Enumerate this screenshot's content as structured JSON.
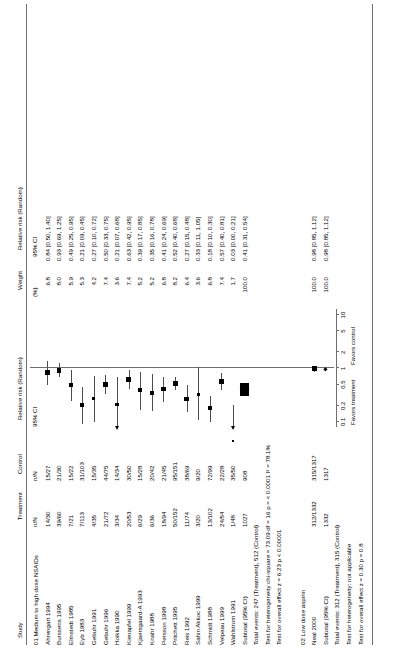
{
  "headers": {
    "study": "Study",
    "treatment_l1": "Treatment",
    "treatment_l2": "n/N",
    "control_l1": "Control",
    "control_l2": "n/N",
    "forest_l1": "Relative risk (Random)",
    "forest_l2": "95% CI",
    "weight_l1": "Weight",
    "weight_l2": "(%)",
    "rr_l1": "Relative risk (Random)",
    "rr_l2": "95% CI"
  },
  "axis": {
    "ticks": [
      "0.1",
      "0.2",
      "0.5",
      "1",
      "2",
      "5",
      "10"
    ],
    "tick_values": [
      0.1,
      0.2,
      0.5,
      1,
      2,
      5,
      10
    ],
    "favors_left": "Favors treatment",
    "favors_right": "Favors control",
    "xmin": 0.08,
    "xmax": 13
  },
  "groups": [
    {
      "label": "01 Medium to high dose NSAIDs",
      "studies": [
        {
          "name": "Ahrengart 1994",
          "treatment": "14/30",
          "control": "15/27",
          "weight": "6.8",
          "rr_text": "0.84 [0.50, 1.40]",
          "rr": 0.84,
          "lo": 0.5,
          "hi": 1.4
        },
        {
          "name": "Burssens 1995",
          "treatment": "39/60",
          "control": "21/30",
          "weight": "8.0",
          "rr_text": "0.93 [0.69, 1.25]",
          "rr": 0.93,
          "lo": 0.69,
          "hi": 1.25
        },
        {
          "name": "Elmstedt 1985",
          "treatment": "7/21",
          "control": "15/22",
          "weight": "5.9",
          "rr_text": "0.49 [0.25, 0.95]",
          "rr": 0.49,
          "lo": 0.25,
          "hi": 0.95
        },
        {
          "name": "Eyb 1983",
          "treatment": "7/113",
          "control": "31/103",
          "weight": "5.3",
          "rr_text": "0.21 [0.09, 0.45]",
          "rr": 0.21,
          "lo": 0.09,
          "hi": 0.45
        },
        {
          "name": "Gebuhr 1991",
          "treatment": "4/35",
          "control": "15/35",
          "weight": "4.2",
          "rr_text": "0.27 [0.10, 0.72]",
          "rr": 0.27,
          "lo": 0.1,
          "hi": 0.72
        },
        {
          "name": "Gebuhr 1996",
          "treatment": "21/72",
          "control": "44/75",
          "weight": "7.4",
          "rr_text": "0.50 [0.33, 0.75]",
          "rr": 0.5,
          "lo": 0.33,
          "hi": 0.75
        },
        {
          "name": "Hoikka 1990",
          "treatment": "3/34",
          "control": "14/34",
          "weight": "3.6",
          "rr_text": "0.21 [0.07, 0.68]",
          "rr": 0.21,
          "lo": 0.07,
          "hi": 0.68
        },
        {
          "name": "Kienapfel 1999",
          "treatment": "20/53",
          "control": "30/50",
          "weight": "7.4",
          "rr_text": "0.63 [0.42, 0.95]",
          "rr": 0.63,
          "lo": 0.42,
          "hi": 0.95
        },
        {
          "name": "Kjaersgaard-A 1993",
          "treatment": "6/29",
          "control": "15/28",
          "weight": "5.2",
          "rr_text": "0.39 [0.17, 0.85]",
          "rr": 0.39,
          "lo": 0.17,
          "hi": 0.85
        },
        {
          "name": "Knahr 1988",
          "treatment": "6/36",
          "control": "20/42",
          "weight": "5.2",
          "rr_text": "0.35 [0.16, 0.78]",
          "rr": 0.35,
          "lo": 0.16,
          "hi": 0.78
        },
        {
          "name": "Persson 1998",
          "treatment": "18/94",
          "control": "21/45",
          "weight": "6.8",
          "rr_text": "0.41 [0.24, 0.69]",
          "rr": 0.41,
          "lo": 0.24,
          "hi": 0.69
        },
        {
          "name": "Pritchett 1995",
          "treatment": "50/152",
          "control": "95/151",
          "weight": "8.2",
          "rr_text": "0.52 [0.40, 0.68]",
          "rr": 0.52,
          "lo": 0.4,
          "hi": 0.68
        },
        {
          "name": "Reis 1992",
          "treatment": "11/74",
          "control": "38/69",
          "weight": "6.4",
          "rr_text": "0.27 [0.15, 0.48]",
          "rr": 0.27,
          "lo": 0.15,
          "hi": 0.48
        },
        {
          "name": "Sahin Akkoc 1999",
          "treatment": "3/20",
          "control": "9/20",
          "weight": "3.6",
          "rr_text": "0.33 [0.11, 1.05]",
          "rr": 0.33,
          "lo": 0.11,
          "hi": 1.05
        },
        {
          "name": "Schmidt 1988",
          "treatment": "13/102",
          "control": "72/99",
          "weight": "6.8",
          "rr_text": "0.18 [0.10, 0.30]",
          "rr": 0.18,
          "lo": 0.1,
          "hi": 0.3
        },
        {
          "name": "Velpeau 1999",
          "treatment": "24/54",
          "control": "22/28",
          "weight": "7.4",
          "rr_text": "0.57 [0.40, 0.81]",
          "rr": 0.57,
          "lo": 0.4,
          "hi": 0.81
        },
        {
          "name": "Wahlstrom 1991",
          "treatment": "1/48",
          "control": "35/50",
          "weight": "1.7",
          "rr_text": "0.03 [0.00, 0.21]",
          "rr": 0.03,
          "lo": 0.004,
          "hi": 0.21
        }
      ],
      "subtotal": {
        "label": "Subtotal (95% CI)",
        "treatment": "1027",
        "control": "908",
        "weight": "100.0",
        "rr_text": "0.41 [0.31, 0.54]",
        "rr": 0.41,
        "lo": 0.31,
        "hi": 0.54
      },
      "stats": [
        "Total events: 247 (Treatment), 512 (Control)",
        "Test for heterogeneity chi-square = 73.09 df = 16 p = < 0.0001 I² = 78.1%",
        "Test for overall effect z = 6.23 p < 0.00001"
      ]
    },
    {
      "label": "02 Low dose aspirin",
      "studies": [
        {
          "name": "Neal 2000",
          "treatment": "312/1332",
          "control": "315/1317",
          "weight": "100.0",
          "rr_text": "0.98 [0.85, 1.12]",
          "rr": 0.98,
          "lo": 0.85,
          "hi": 1.12
        }
      ],
      "subtotal": {
        "label": "Subtotal (95% CI)",
        "treatment": "1332",
        "control": "1317",
        "weight": "100.0",
        "rr_text": "0.98 [0.85, 1.12]",
        "rr": 0.98,
        "lo": 0.85,
        "hi": 1.12
      },
      "stats": [
        "Total events: 312 (Treatment), 315 (Control)",
        "Test for heterogeneity: not applicable",
        "Test for overall effect z = 0.30 p = 0.8"
      ]
    }
  ],
  "chart_data": {
    "type": "forest",
    "title": "",
    "xlabel": "Relative risk (Random) 95% CI",
    "x_scale": "log",
    "x_ticks": [
      0.1,
      0.2,
      0.5,
      1,
      2,
      5,
      10
    ],
    "no_effect_line": 1,
    "series": [
      {
        "name": "Ahrengart 1994",
        "rr": 0.84,
        "ci": [
          0.5,
          1.4
        ],
        "weight": 6.8
      },
      {
        "name": "Burssens 1995",
        "rr": 0.93,
        "ci": [
          0.69,
          1.25
        ],
        "weight": 8.0
      },
      {
        "name": "Elmstedt 1985",
        "rr": 0.49,
        "ci": [
          0.25,
          0.95
        ],
        "weight": 5.9
      },
      {
        "name": "Eyb 1983",
        "rr": 0.21,
        "ci": [
          0.09,
          0.45
        ],
        "weight": 5.3
      },
      {
        "name": "Gebuhr 1991",
        "rr": 0.27,
        "ci": [
          0.1,
          0.72
        ],
        "weight": 4.2
      },
      {
        "name": "Gebuhr 1996",
        "rr": 0.5,
        "ci": [
          0.33,
          0.75
        ],
        "weight": 7.4
      },
      {
        "name": "Hoikka 1990",
        "rr": 0.21,
        "ci": [
          0.07,
          0.68
        ],
        "weight": 3.6
      },
      {
        "name": "Kienapfel 1999",
        "rr": 0.63,
        "ci": [
          0.42,
          0.95
        ],
        "weight": 7.4
      },
      {
        "name": "Kjaersgaard-A 1993",
        "rr": 0.39,
        "ci": [
          0.17,
          0.85
        ],
        "weight": 5.2
      },
      {
        "name": "Knahr 1988",
        "rr": 0.35,
        "ci": [
          0.16,
          0.78
        ],
        "weight": 5.2
      },
      {
        "name": "Persson 1998",
        "rr": 0.41,
        "ci": [
          0.24,
          0.69
        ],
        "weight": 6.8
      },
      {
        "name": "Pritchett 1995",
        "rr": 0.52,
        "ci": [
          0.4,
          0.68
        ],
        "weight": 8.2
      },
      {
        "name": "Reis 1992",
        "rr": 0.27,
        "ci": [
          0.15,
          0.48
        ],
        "weight": 6.4
      },
      {
        "name": "Sahin Akkoc 1999",
        "rr": 0.33,
        "ci": [
          0.11,
          1.05
        ],
        "weight": 3.6
      },
      {
        "name": "Schmidt 1988",
        "rr": 0.18,
        "ci": [
          0.1,
          0.3
        ],
        "weight": 6.8
      },
      {
        "name": "Velpeau 1999",
        "rr": 0.57,
        "ci": [
          0.4,
          0.81
        ],
        "weight": 7.4
      },
      {
        "name": "Wahlstrom 1991",
        "rr": 0.03,
        "ci": [
          0.004,
          0.21
        ],
        "weight": 1.7
      },
      {
        "name": "Subtotal 01",
        "rr": 0.41,
        "ci": [
          0.31,
          0.54
        ],
        "weight": 100.0,
        "pooled": true
      },
      {
        "name": "Neal 2000",
        "rr": 0.98,
        "ci": [
          0.85,
          1.12
        ],
        "weight": 100.0
      },
      {
        "name": "Subtotal 02",
        "rr": 0.98,
        "ci": [
          0.85,
          1.12
        ],
        "weight": 100.0,
        "pooled": true
      }
    ]
  }
}
